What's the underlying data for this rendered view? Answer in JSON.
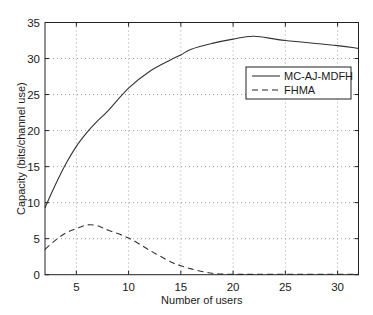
{
  "chart_data": {
    "type": "line",
    "title": "",
    "xlabel": "Number of users",
    "ylabel": "Capacity (bits/channel use)",
    "xlim": [
      2,
      32
    ],
    "ylim": [
      0,
      35
    ],
    "xticks": [
      5,
      10,
      15,
      20,
      25,
      30
    ],
    "yticks": [
      0,
      5,
      10,
      15,
      20,
      25,
      30,
      35
    ],
    "grid": true,
    "legend_position": "upper right (inside)",
    "x": [
      2,
      3,
      4,
      5,
      6,
      7,
      8,
      10,
      12,
      14,
      15,
      16,
      18,
      20,
      22,
      25,
      30,
      32
    ],
    "series": [
      {
        "name": "MC-AJ-MDFH",
        "style": "solid",
        "values": [
          9.3,
          12.5,
          15.4,
          17.8,
          19.7,
          21.3,
          22.7,
          25.9,
          28.2,
          29.8,
          30.5,
          31.3,
          32.1,
          32.7,
          33.1,
          32.5,
          31.8,
          31.4
        ]
      },
      {
        "name": "FHMA",
        "style": "dashed",
        "values": [
          3.5,
          4.8,
          5.8,
          6.4,
          6.9,
          6.8,
          6.2,
          5.1,
          3.4,
          1.8,
          1.25,
          0.8,
          0.2,
          0.05,
          0.05,
          0.05,
          0.05,
          0.05
        ]
      }
    ]
  },
  "legend": {
    "items": [
      {
        "label": "MC-AJ-MDFH"
      },
      {
        "label": "FHMA"
      }
    ]
  }
}
